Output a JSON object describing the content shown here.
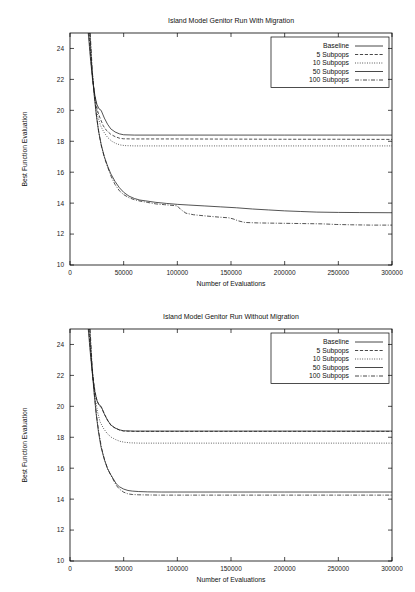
{
  "figure": {
    "background": "#ffffff",
    "ink": "#1b1b1b",
    "width": 415,
    "height": 592
  },
  "chart_data": [
    {
      "id": "with-migration",
      "type": "line",
      "title": "Island Model Genitor Run With Migration",
      "xlabel": "Number of Evaluations",
      "ylabel": "Best Function Evaluation",
      "xlim": [
        0,
        300000
      ],
      "ylim": [
        10,
        25
      ],
      "xticks": [
        0,
        50000,
        100000,
        150000,
        200000,
        250000,
        300000
      ],
      "xticklabels": [
        "0",
        "50000",
        "100000",
        "150000",
        "200000",
        "250000",
        "300000"
      ],
      "yticks": [
        10,
        12,
        14,
        16,
        18,
        20,
        22,
        24
      ],
      "yticklabels": [
        "10",
        "12",
        "14",
        "16",
        "18",
        "20",
        "22",
        "24"
      ],
      "grid": false,
      "legend_position": "top-right",
      "series": [
        {
          "name": "Baseline",
          "dash": "none",
          "points": [
            [
              17000,
              25.0
            ],
            [
              19000,
              23.4
            ],
            [
              21000,
              22.0
            ],
            [
              23000,
              21.0
            ],
            [
              25000,
              20.4
            ],
            [
              27000,
              20.1
            ],
            [
              29000,
              20.0
            ],
            [
              32000,
              19.5
            ],
            [
              35000,
              19.1
            ],
            [
              38000,
              18.8
            ],
            [
              42000,
              18.6
            ],
            [
              46000,
              18.48
            ],
            [
              50000,
              18.42
            ],
            [
              60000,
              18.4
            ],
            [
              100000,
              18.4
            ],
            [
              150000,
              18.4
            ],
            [
              200000,
              18.4
            ],
            [
              250000,
              18.4
            ],
            [
              300000,
              18.4
            ]
          ]
        },
        {
          "name": "5 Subpops",
          "dash": "dashed",
          "points": [
            [
              17500,
              25.0
            ],
            [
              19500,
              23.2
            ],
            [
              21500,
              21.8
            ],
            [
              23500,
              20.8
            ],
            [
              25500,
              20.0
            ],
            [
              28000,
              19.5
            ],
            [
              31000,
              19.0
            ],
            [
              34000,
              18.7
            ],
            [
              38000,
              18.45
            ],
            [
              42000,
              18.3
            ],
            [
              46000,
              18.2
            ],
            [
              50000,
              18.16
            ],
            [
              60000,
              18.15
            ],
            [
              100000,
              18.15
            ],
            [
              150000,
              18.14
            ],
            [
              200000,
              18.13
            ],
            [
              250000,
              18.13
            ],
            [
              300000,
              18.12
            ]
          ]
        },
        {
          "name": "10 Subpops",
          "dash": "dotted",
          "points": [
            [
              18000,
              25.0
            ],
            [
              20000,
              23.0
            ],
            [
              22000,
              21.5
            ],
            [
              24000,
              20.4
            ],
            [
              26000,
              19.6
            ],
            [
              28500,
              19.0
            ],
            [
              31500,
              18.6
            ],
            [
              35000,
              18.25
            ],
            [
              39000,
              18.0
            ],
            [
              43000,
              17.85
            ],
            [
              47000,
              17.76
            ],
            [
              51000,
              17.72
            ],
            [
              60000,
              17.7
            ],
            [
              100000,
              17.7
            ],
            [
              150000,
              17.7
            ],
            [
              200000,
              17.7
            ],
            [
              250000,
              17.7
            ],
            [
              300000,
              17.7
            ]
          ]
        },
        {
          "name": "50 Subpops",
          "dash": "thin",
          "points": [
            [
              18500,
              25.0
            ],
            [
              20500,
              22.6
            ],
            [
              22500,
              21.0
            ],
            [
              24500,
              19.7
            ],
            [
              26500,
              18.7
            ],
            [
              29000,
              17.8
            ],
            [
              32000,
              17.0
            ],
            [
              35000,
              16.4
            ],
            [
              38000,
              15.9
            ],
            [
              42000,
              15.4
            ],
            [
              46000,
              15.0
            ],
            [
              50000,
              14.7
            ],
            [
              55000,
              14.45
            ],
            [
              60000,
              14.3
            ],
            [
              65000,
              14.2
            ],
            [
              70000,
              14.15
            ],
            [
              80000,
              14.05
            ],
            [
              90000,
              13.98
            ],
            [
              100000,
              13.92
            ],
            [
              110000,
              13.88
            ],
            [
              125000,
              13.82
            ],
            [
              140000,
              13.76
            ],
            [
              155000,
              13.7
            ],
            [
              170000,
              13.62
            ],
            [
              185000,
              13.56
            ],
            [
              200000,
              13.5
            ],
            [
              215000,
              13.46
            ],
            [
              230000,
              13.42
            ],
            [
              250000,
              13.4
            ],
            [
              270000,
              13.39
            ],
            [
              300000,
              13.38
            ]
          ]
        },
        {
          "name": "100 Subpops",
          "dash": "dashdot",
          "points": [
            [
              18800,
              25.0
            ],
            [
              20800,
              22.5
            ],
            [
              22800,
              20.9
            ],
            [
              24800,
              19.6
            ],
            [
              27000,
              18.5
            ],
            [
              29500,
              17.6
            ],
            [
              32500,
              16.85
            ],
            [
              35500,
              16.25
            ],
            [
              38500,
              15.7
            ],
            [
              42000,
              15.2
            ],
            [
              46000,
              14.8
            ],
            [
              50000,
              14.55
            ],
            [
              55000,
              14.35
            ],
            [
              60000,
              14.22
            ],
            [
              66000,
              14.12
            ],
            [
              72000,
              14.05
            ],
            [
              80000,
              13.95
            ],
            [
              88000,
              13.9
            ],
            [
              96000,
              13.85
            ],
            [
              100000,
              13.82
            ],
            [
              103000,
              13.6
            ],
            [
              108000,
              13.35
            ],
            [
              115000,
              13.25
            ],
            [
              125000,
              13.18
            ],
            [
              138000,
              13.1
            ],
            [
              148000,
              13.05
            ],
            [
              152000,
              12.98
            ],
            [
              157000,
              12.85
            ],
            [
              163000,
              12.75
            ],
            [
              175000,
              12.72
            ],
            [
              195000,
              12.7
            ],
            [
              215000,
              12.68
            ],
            [
              235000,
              12.66
            ],
            [
              248000,
              12.62
            ],
            [
              262000,
              12.6
            ],
            [
              280000,
              12.58
            ],
            [
              300000,
              12.58
            ]
          ]
        }
      ]
    },
    {
      "id": "without-migration",
      "type": "line",
      "title": "Island Model Genitor Run Without Migration",
      "xlabel": "Number of Evaluations",
      "ylabel": "Best Function Evaluation",
      "xlim": [
        0,
        300000
      ],
      "ylim": [
        10,
        25
      ],
      "xticks": [
        0,
        50000,
        100000,
        150000,
        200000,
        250000,
        300000
      ],
      "xticklabels": [
        "0",
        "50000",
        "100000",
        "150000",
        "200000",
        "250000",
        "300000"
      ],
      "yticks": [
        10,
        12,
        14,
        16,
        18,
        20,
        22,
        24
      ],
      "yticklabels": [
        "10",
        "12",
        "14",
        "16",
        "18",
        "20",
        "22",
        "24"
      ],
      "grid": false,
      "legend_position": "top-right",
      "series": [
        {
          "name": "Baseline",
          "dash": "none",
          "points": [
            [
              17000,
              25.0
            ],
            [
              19000,
              23.4
            ],
            [
              21000,
              22.0
            ],
            [
              23000,
              21.0
            ],
            [
              25000,
              20.4
            ],
            [
              27000,
              20.1
            ],
            [
              29000,
              20.0
            ],
            [
              32000,
              19.5
            ],
            [
              35000,
              19.1
            ],
            [
              38000,
              18.8
            ],
            [
              42000,
              18.6
            ],
            [
              46000,
              18.48
            ],
            [
              50000,
              18.42
            ],
            [
              60000,
              18.4
            ],
            [
              100000,
              18.4
            ],
            [
              150000,
              18.4
            ],
            [
              200000,
              18.4
            ],
            [
              250000,
              18.4
            ],
            [
              300000,
              18.4
            ]
          ]
        },
        {
          "name": "5 Subpops",
          "dash": "dashed",
          "points": [
            [
              17400,
              25.0
            ],
            [
              19400,
              23.3
            ],
            [
              21400,
              21.9
            ],
            [
              23400,
              20.9
            ],
            [
              25400,
              20.3
            ],
            [
              27400,
              20.05
            ],
            [
              29400,
              19.9
            ],
            [
              32400,
              19.45
            ],
            [
              35400,
              19.05
            ],
            [
              38400,
              18.75
            ],
            [
              42400,
              18.58
            ],
            [
              46400,
              18.46
            ],
            [
              50000,
              18.4
            ],
            [
              60000,
              18.38
            ],
            [
              100000,
              18.38
            ],
            [
              150000,
              18.38
            ],
            [
              200000,
              18.38
            ],
            [
              250000,
              18.38
            ],
            [
              300000,
              18.38
            ]
          ]
        },
        {
          "name": "10 Subpops",
          "dash": "dotted",
          "points": [
            [
              17800,
              25.0
            ],
            [
              19800,
              23.0
            ],
            [
              21800,
              21.5
            ],
            [
              23800,
              20.4
            ],
            [
              25800,
              19.6
            ],
            [
              28000,
              19.0
            ],
            [
              31000,
              18.6
            ],
            [
              34500,
              18.25
            ],
            [
              38500,
              18.0
            ],
            [
              42500,
              17.85
            ],
            [
              46500,
              17.74
            ],
            [
              50500,
              17.68
            ],
            [
              56000,
              17.64
            ],
            [
              65000,
              17.62
            ],
            [
              100000,
              17.62
            ],
            [
              150000,
              17.62
            ],
            [
              200000,
              17.62
            ],
            [
              250000,
              17.62
            ],
            [
              300000,
              17.62
            ]
          ]
        },
        {
          "name": "50 Subpops",
          "dash": "thin",
          "points": [
            [
              18400,
              25.0
            ],
            [
              20400,
              22.6
            ],
            [
              22400,
              20.9
            ],
            [
              24400,
              19.5
            ],
            [
              26400,
              18.4
            ],
            [
              28800,
              17.4
            ],
            [
              31800,
              16.6
            ],
            [
              34800,
              16.0
            ],
            [
              37800,
              15.6
            ],
            [
              40000,
              15.35
            ],
            [
              43000,
              15.0
            ],
            [
              46000,
              14.8
            ],
            [
              50000,
              14.65
            ],
            [
              54000,
              14.56
            ],
            [
              58000,
              14.52
            ],
            [
              64000,
              14.49
            ],
            [
              72000,
              14.47
            ],
            [
              85000,
              14.46
            ],
            [
              100000,
              14.46
            ],
            [
              150000,
              14.46
            ],
            [
              200000,
              14.46
            ],
            [
              250000,
              14.46
            ],
            [
              300000,
              14.46
            ]
          ]
        },
        {
          "name": "100 Subpops",
          "dash": "dashdot",
          "points": [
            [
              18700,
              25.0
            ],
            [
              20700,
              22.5
            ],
            [
              22700,
              20.8
            ],
            [
              24700,
              19.4
            ],
            [
              26900,
              18.3
            ],
            [
              29400,
              17.3
            ],
            [
              32400,
              16.5
            ],
            [
              35400,
              15.9
            ],
            [
              38400,
              15.5
            ],
            [
              40000,
              15.3
            ],
            [
              43000,
              14.9
            ],
            [
              46000,
              14.65
            ],
            [
              50000,
              14.45
            ],
            [
              54000,
              14.34
            ],
            [
              58000,
              14.3
            ],
            [
              64000,
              14.28
            ],
            [
              72000,
              14.27
            ],
            [
              85000,
              14.26
            ],
            [
              100000,
              14.26
            ],
            [
              150000,
              14.26
            ],
            [
              200000,
              14.26
            ],
            [
              250000,
              14.26
            ],
            [
              300000,
              14.26
            ]
          ]
        }
      ]
    }
  ]
}
